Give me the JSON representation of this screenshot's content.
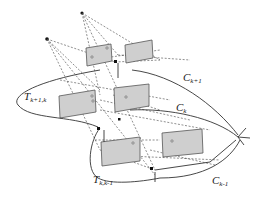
{
  "labels": {
    "C_k_plus_1": {
      "main": "C",
      "sub": "k+1"
    },
    "C_k": {
      "main": "C",
      "sub": "k"
    },
    "C_k_minus_1": {
      "main": "C",
      "sub": "k-1"
    },
    "T_k_plus_1_k": {
      "main": "T",
      "sub": "k+1,k"
    },
    "T_k_k_minus_1": {
      "main": "T",
      "sub": "k,k-1"
    }
  },
  "colors": {
    "plane_fill": "#cfcfcf",
    "line": "#333333",
    "background": "#ffffff"
  }
}
